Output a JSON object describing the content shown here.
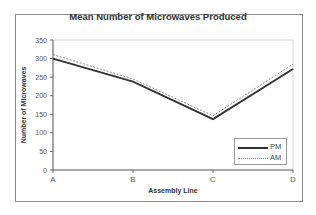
{
  "chart_data": {
    "type": "line",
    "title": "Mean Number of Microwaves Produced",
    "xlabel": "Assembly Line",
    "ylabel": "Number of Microwaves",
    "categories": [
      "A",
      "B",
      "C",
      "D"
    ],
    "series": [
      {
        "name": "PM",
        "values": [
          300,
          238,
          137,
          272
        ],
        "style": "solid",
        "color": "#333333"
      },
      {
        "name": "AM",
        "values": [
          311,
          245,
          146,
          285
        ],
        "style": "dotted",
        "color": "#888888"
      }
    ],
    "ylim": [
      0,
      350
    ],
    "yticks": [
      0,
      50,
      100,
      150,
      200,
      250,
      300,
      350
    ],
    "grid": false,
    "legend_position": "lower right"
  },
  "legend": [
    {
      "label": "PM"
    },
    {
      "label": "AM"
    }
  ]
}
